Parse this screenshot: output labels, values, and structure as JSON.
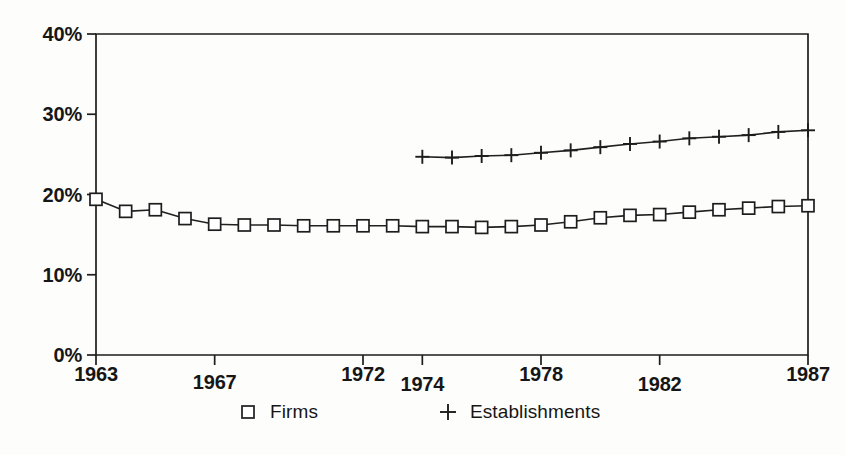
{
  "figure": {
    "background_color": "#fdfdfc",
    "ink_color": "#1d1d1d"
  },
  "chart_data": {
    "type": "line",
    "title": "",
    "subtitle": "",
    "xlabel": "",
    "ylabel": "",
    "xlim": [
      1963,
      1987
    ],
    "ylim": [
      0,
      40
    ],
    "grid": false,
    "legend_position": "bottom",
    "y_tick_labels": [
      "0%",
      "10%",
      "20%",
      "30%",
      "40%"
    ],
    "y_tick_values": [
      0,
      10,
      20,
      30,
      40
    ],
    "x_tick_labels": [
      "1963",
      "1967",
      "1972",
      "1974",
      "1978",
      "1982",
      "1987"
    ],
    "x_tick_values": [
      1963,
      1967,
      1972,
      1974,
      1978,
      1982,
      1987
    ],
    "series": [
      {
        "name": "Firms",
        "marker": "square",
        "x": [
          1963,
          1964,
          1965,
          1966,
          1967,
          1968,
          1969,
          1970,
          1971,
          1972,
          1973,
          1974,
          1975,
          1976,
          1977,
          1978,
          1979,
          1980,
          1981,
          1982,
          1983,
          1984,
          1985,
          1986,
          1987
        ],
        "values": [
          19.4,
          17.9,
          18.1,
          17.0,
          16.3,
          16.2,
          16.2,
          16.1,
          16.1,
          16.1,
          16.1,
          16.0,
          16.0,
          15.9,
          16.0,
          16.2,
          16.6,
          17.1,
          17.4,
          17.5,
          17.8,
          18.1,
          18.3,
          18.5,
          18.6
        ]
      },
      {
        "name": "Establishments",
        "marker": "plus",
        "x": [
          1974,
          1975,
          1976,
          1977,
          1978,
          1979,
          1980,
          1981,
          1982,
          1983,
          1984,
          1985,
          1986,
          1987
        ],
        "values": [
          24.7,
          24.6,
          24.8,
          24.9,
          25.2,
          25.5,
          25.9,
          26.3,
          26.6,
          27.0,
          27.2,
          27.4,
          27.8,
          28.0
        ]
      }
    ]
  },
  "legend": {
    "entries": [
      {
        "marker": "square",
        "label": "Firms"
      },
      {
        "marker": "plus",
        "label": "Establishments"
      }
    ]
  }
}
